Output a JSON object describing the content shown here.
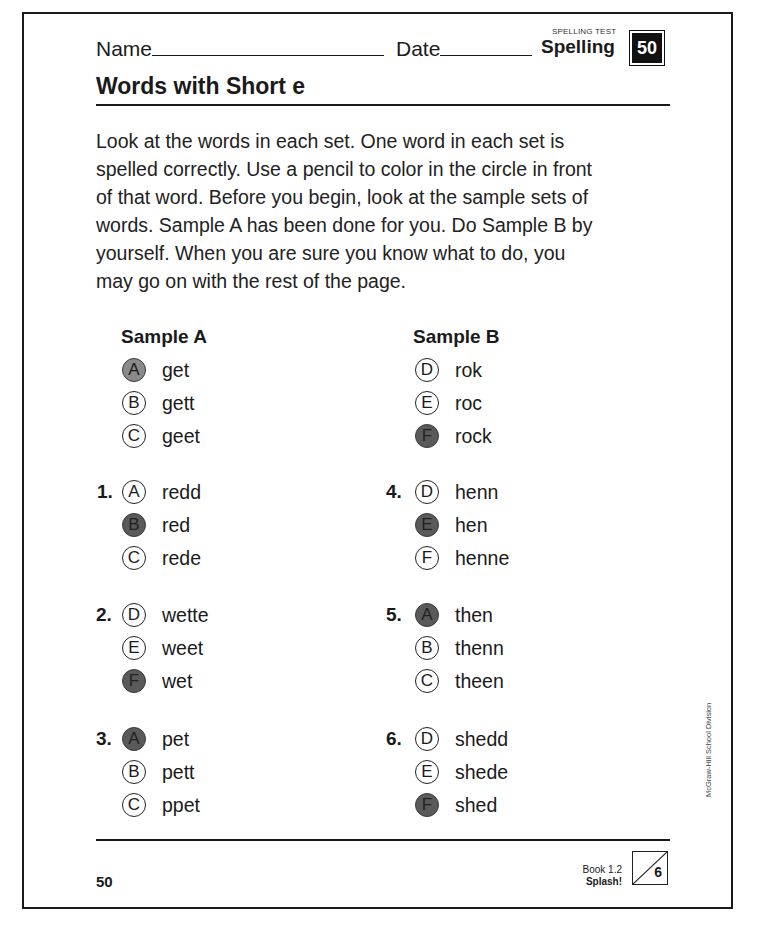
{
  "header": {
    "name_label": "Name",
    "date_label": "Date",
    "test_type": "SPELLING TEST",
    "subject": "Spelling",
    "lesson_number": "50"
  },
  "title": "Words with Short e",
  "instructions": "Look at the words in each set. One word in each set is spelled correctly. Use a pencil to color in the circle in front of that word. Before you begin, look at the sample sets of words. Sample A has been done for you. Do Sample B by yourself. When you are sure you know what to do, you may go on with the rest of the page.",
  "samples": [
    {
      "heading": "Sample A",
      "options": [
        {
          "letter": "A",
          "word": "get",
          "filled": true
        },
        {
          "letter": "B",
          "word": "gett",
          "filled": false
        },
        {
          "letter": "C",
          "word": "geet",
          "filled": false
        }
      ]
    },
    {
      "heading": "Sample B",
      "options": [
        {
          "letter": "D",
          "word": "rok",
          "filled": false
        },
        {
          "letter": "E",
          "word": "roc",
          "filled": false
        },
        {
          "letter": "F",
          "word": "rock",
          "filled": true
        }
      ]
    }
  ],
  "questions": [
    {
      "number": "1.",
      "options": [
        {
          "letter": "A",
          "word": "redd",
          "filled": false
        },
        {
          "letter": "B",
          "word": "red",
          "filled": true
        },
        {
          "letter": "C",
          "word": "rede",
          "filled": false
        }
      ]
    },
    {
      "number": "2.",
      "options": [
        {
          "letter": "D",
          "word": "wette",
          "filled": false
        },
        {
          "letter": "E",
          "word": "weet",
          "filled": false
        },
        {
          "letter": "F",
          "word": "wet",
          "filled": true
        }
      ]
    },
    {
      "number": "3.",
      "options": [
        {
          "letter": "A",
          "word": "pet",
          "filled": true
        },
        {
          "letter": "B",
          "word": "pett",
          "filled": false
        },
        {
          "letter": "C",
          "word": "ppet",
          "filled": false
        }
      ]
    },
    {
      "number": "4.",
      "options": [
        {
          "letter": "D",
          "word": "henn",
          "filled": false
        },
        {
          "letter": "E",
          "word": "hen",
          "filled": true
        },
        {
          "letter": "F",
          "word": "henne",
          "filled": false
        }
      ]
    },
    {
      "number": "5.",
      "options": [
        {
          "letter": "A",
          "word": "then",
          "filled": true
        },
        {
          "letter": "B",
          "word": "thenn",
          "filled": false
        },
        {
          "letter": "C",
          "word": "theen",
          "filled": false
        }
      ]
    },
    {
      "number": "6.",
      "options": [
        {
          "letter": "D",
          "word": "shedd",
          "filled": false
        },
        {
          "letter": "E",
          "word": "shede",
          "filled": false
        },
        {
          "letter": "F",
          "word": "shed",
          "filled": true
        }
      ]
    }
  ],
  "footer": {
    "page_number": "50",
    "book": "Book 1.2",
    "book_title": "Splash!",
    "unit": "6"
  },
  "side_credit": "McGraw-Hill School Division"
}
